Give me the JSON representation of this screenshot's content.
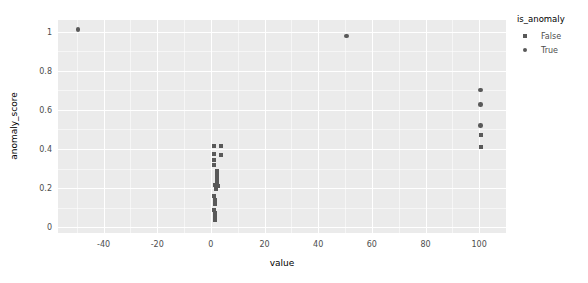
{
  "chart_data": {
    "type": "scatter",
    "title": "",
    "xlabel": "value",
    "ylabel": "anomaly_score",
    "xlim": [
      -57,
      110
    ],
    "ylim": [
      -0.03,
      1.06
    ],
    "grid": true,
    "x_ticks": [
      -40,
      -20,
      0,
      20,
      40,
      60,
      80,
      100
    ],
    "x_tick_labels": [
      "-40",
      "-20",
      "0",
      "20",
      "40",
      "60",
      "80",
      "100"
    ],
    "y_ticks": [
      0,
      0.2,
      0.4,
      0.6,
      0.8,
      1
    ],
    "y_tick_labels": [
      "0",
      "0.2",
      "0.4",
      "0.6",
      "0.8",
      "1"
    ],
    "legend": {
      "title": "is_anomaly",
      "position": "right",
      "entries": [
        {
          "label": "False",
          "marker": "square",
          "color": "#595959"
        },
        {
          "label": "True",
          "marker": "circle",
          "color": "#595959"
        }
      ]
    },
    "series": [
      {
        "name": "False",
        "marker": "square",
        "color": "#595959",
        "points": [
          [
            1.0,
            0.415
          ],
          [
            3.6,
            0.413
          ],
          [
            1.1,
            0.372
          ],
          [
            3.9,
            0.368
          ],
          [
            1.0,
            0.343
          ],
          [
            1.0,
            0.318
          ],
          [
            2.2,
            0.288
          ],
          [
            2.2,
            0.268
          ],
          [
            2.3,
            0.249
          ],
          [
            2.3,
            0.232
          ],
          [
            1.6,
            0.214
          ],
          [
            2.6,
            0.208
          ],
          [
            2.0,
            0.196
          ],
          [
            1.2,
            0.16
          ],
          [
            1.4,
            0.139
          ],
          [
            1.5,
            0.12
          ],
          [
            1.3,
            0.09
          ],
          [
            1.4,
            0.072
          ],
          [
            1.5,
            0.052
          ],
          [
            1.4,
            0.035
          ],
          [
            100.5,
            0.47
          ],
          [
            100.5,
            0.41
          ]
        ]
      },
      {
        "name": "True",
        "marker": "circle",
        "color": "#595959",
        "points": [
          [
            -49.5,
            1.012
          ],
          [
            50.5,
            0.978
          ],
          [
            100.5,
            0.702
          ],
          [
            100.5,
            0.628
          ],
          [
            100.5,
            0.52
          ]
        ]
      }
    ]
  },
  "axis": {
    "x_title": "value",
    "y_title": "anomaly_score"
  },
  "legend": {
    "title": "is_anomaly",
    "false_label": "False",
    "true_label": "True"
  },
  "style": {
    "panel_background": "#ebebeb",
    "gridline_color": "#ffffff",
    "marker_color": "#595959",
    "text_color": "#4d4d4d",
    "figure_background": "#ffffff"
  }
}
